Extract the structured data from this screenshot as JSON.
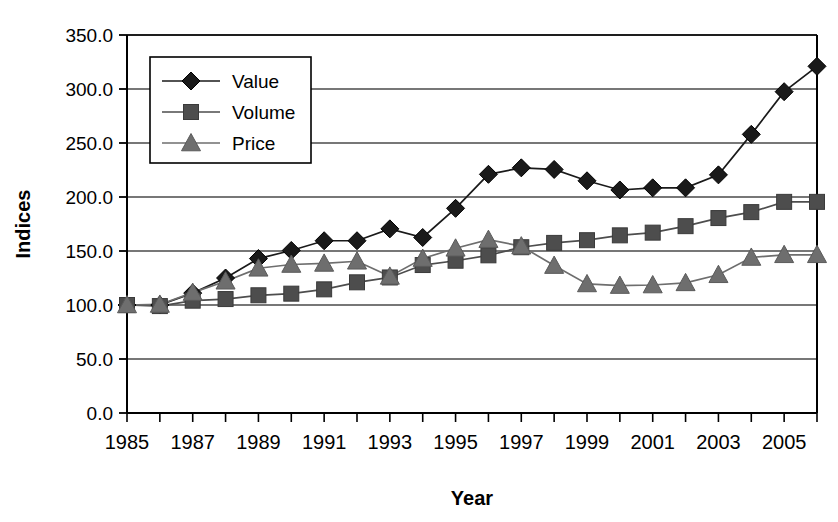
{
  "chart_data": {
    "type": "line",
    "title": "",
    "xlabel": "Year",
    "ylabel": "Indices",
    "x": [
      1985,
      1986,
      1987,
      1988,
      1989,
      1990,
      1991,
      1992,
      1993,
      1994,
      1995,
      1996,
      1997,
      1998,
      1999,
      2000,
      2001,
      2002,
      2003,
      2004,
      2005,
      2006
    ],
    "xtick_labels": [
      "1985",
      "",
      "1987",
      "",
      "1989",
      "",
      "1991",
      "",
      "1993",
      "",
      "1995",
      "",
      "1997",
      "",
      "1999",
      "",
      "2001",
      "",
      "2003",
      "",
      "2005",
      ""
    ],
    "xlim": [
      1985,
      2006
    ],
    "ylim": [
      0.0,
      350.0
    ],
    "ytick_labels": [
      "0.0",
      "50.0",
      "100.0",
      "150.0",
      "200.0",
      "250.0",
      "300.0",
      "350.0"
    ],
    "ytick_values": [
      0,
      50,
      100,
      150,
      200,
      250,
      300,
      350
    ],
    "grid": true,
    "legend_position": "upper-left-inside",
    "series": [
      {
        "name": "Value",
        "marker": "diamond",
        "color": "#1a1a1a",
        "values": [
          100.0,
          100.0,
          111.0,
          125.0,
          143.0,
          150.5,
          159.5,
          159.5,
          170.5,
          162.5,
          189.5,
          221.0,
          227.0,
          225.5,
          215.0,
          206.5,
          208.5,
          208.5,
          220.5,
          258.0,
          297.5,
          321.0
        ]
      },
      {
        "name": "Volume",
        "marker": "square",
        "color": "#4d4d4d",
        "values": [
          100.0,
          99.0,
          104.0,
          105.5,
          109.0,
          110.5,
          114.5,
          121.0,
          125.5,
          137.0,
          141.0,
          146.0,
          153.5,
          157.5,
          160.0,
          164.5,
          167.0,
          173.0,
          180.5,
          186.0,
          195.5,
          195.5
        ]
      },
      {
        "name": "Price",
        "marker": "triangle",
        "color": "#6e6e6e",
        "values": [
          100.0,
          100.5,
          111.5,
          122.0,
          134.0,
          137.5,
          138.5,
          140.5,
          126.5,
          143.0,
          152.5,
          160.5,
          154.5,
          136.5,
          119.5,
          118.0,
          118.5,
          120.5,
          128.0,
          144.0,
          146.5,
          146.5
        ]
      }
    ]
  },
  "legend": {
    "items": [
      {
        "label": "Value"
      },
      {
        "label": "Volume"
      },
      {
        "label": "Price"
      }
    ]
  },
  "colors": {
    "axis": "#000000",
    "grid": "#4a4a4a",
    "value": "#1a1a1a",
    "volume": "#4d4d4d",
    "price": "#6e6e6e",
    "background": "#ffffff"
  }
}
